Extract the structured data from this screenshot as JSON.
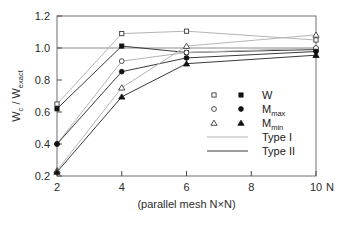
{
  "chart_data": {
    "type": "line",
    "title": "",
    "xlabel": "(parallel mesh N×N)",
    "xaxis_symbol": "N",
    "ylabel": "W_c / W_exact",
    "ylabel_parts": {
      "num": "W",
      "num_sub": "c",
      "den": "W",
      "den_sub": "exact",
      "sep": "/"
    },
    "x": [
      2,
      4,
      6,
      10
    ],
    "xticks": [
      "2",
      "4",
      "6",
      "8",
      "10"
    ],
    "xtick_values": [
      2,
      4,
      6,
      8,
      10
    ],
    "yticks": [
      "0.2",
      "0.4",
      "0.6",
      "0.8",
      "1.0",
      "1.2"
    ],
    "ytick_values": [
      0.2,
      0.4,
      0.6,
      0.8,
      1.0,
      1.2
    ],
    "xlim": [
      2,
      10
    ],
    "ylim": [
      0.2,
      1.2
    ],
    "grid": false,
    "reference_line": {
      "y": 1.0,
      "color": "#8c8c8c"
    },
    "legend_position": "inside-right",
    "series": [
      {
        "name": "W (Type I)",
        "quantity": "W",
        "line_type": "Type I",
        "marker": "open-square",
        "color": "#b5b5b5",
        "values": [
          0.65,
          1.09,
          1.105,
          1.05
        ]
      },
      {
        "name": "W (Type II)",
        "quantity": "W",
        "line_type": "Type II",
        "marker": "filled-square",
        "color": "#3a3a3a",
        "values": [
          0.62,
          1.012,
          0.972,
          0.99
        ]
      },
      {
        "name": "M_max (Type I)",
        "quantity": "M_max",
        "line_type": "Type I",
        "marker": "open-circle",
        "color": "#b5b5b5",
        "values": [
          0.4,
          0.918,
          0.972,
          1.0
        ]
      },
      {
        "name": "M_max (Type II)",
        "quantity": "M_max",
        "line_type": "Type II",
        "marker": "filled-circle",
        "color": "#3a3a3a",
        "values": [
          0.4,
          0.852,
          0.938,
          0.978
        ]
      },
      {
        "name": "M_min (Type I)",
        "quantity": "M_min",
        "line_type": "Type I",
        "marker": "open-triangle",
        "color": "#b5b5b5",
        "values": [
          0.235,
          0.752,
          1.012,
          1.082
        ]
      },
      {
        "name": "M_min (Type II)",
        "quantity": "M_min",
        "line_type": "Type II",
        "marker": "filled-triangle",
        "color": "#3a3a3a",
        "values": [
          0.225,
          0.695,
          0.902,
          0.955
        ]
      }
    ],
    "legend": {
      "marker_rows": [
        {
          "open": "open-square",
          "filled": "filled-square",
          "label": "W",
          "label_sub": ""
        },
        {
          "open": "open-circle",
          "filled": "filled-circle",
          "label": "M",
          "label_sub": "max"
        },
        {
          "open": "open-triangle",
          "filled": "filled-triangle",
          "label": "M",
          "label_sub": "min"
        }
      ],
      "line_rows": [
        {
          "label": "Type I",
          "color": "#b5b5b5"
        },
        {
          "label": "Type II",
          "color": "#3a3a3a"
        }
      ]
    }
  },
  "figure": {
    "caption_artifact": ""
  }
}
